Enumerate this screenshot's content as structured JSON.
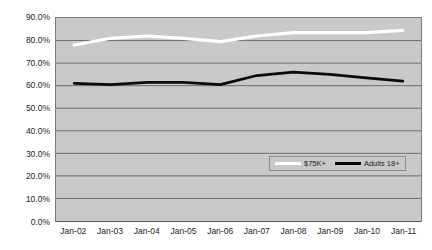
{
  "chart_data": {
    "type": "line",
    "title": "",
    "xlabel": "",
    "ylabel": "",
    "grid": true,
    "legend_position": "inside-bottom-right",
    "categories": [
      "Jan-02",
      "Jan-03",
      "Jan-04",
      "Jan-05",
      "Jan-06",
      "Jan-07",
      "Jan-08",
      "Jan-09",
      "Jan-10",
      "Jan-11"
    ],
    "ylim": [
      0,
      90
    ],
    "ytick_labels": [
      "90.0%",
      "80.0%",
      "70.0%",
      "60.0%",
      "50.0%",
      "40.0%",
      "30.0%",
      "20.0%",
      "10.0%",
      "0.0%"
    ],
    "ytick_values": [
      90,
      80,
      70,
      60,
      50,
      40,
      30,
      20,
      10,
      0
    ],
    "series": [
      {
        "name": "$75K+",
        "color": "#ffffff",
        "values": [
          78.0,
          81.0,
          82.0,
          81.0,
          79.5,
          82.0,
          83.5,
          83.5,
          83.5,
          84.5
        ]
      },
      {
        "name": "Adults 18+",
        "color": "#0a0a0a",
        "values": [
          61.0,
          60.5,
          61.5,
          61.5,
          60.5,
          64.5,
          66.0,
          65.0,
          63.5,
          62.0
        ]
      }
    ]
  },
  "legend": {
    "entries": [
      {
        "label": "$75K+",
        "swatch": "white-line-swatch"
      },
      {
        "label": "Adults 18+",
        "swatch": "black-line-swatch"
      }
    ]
  },
  "colors": {
    "plot_background": "#c9c9c9",
    "page_background": "#ffffff",
    "gridline": "#6f6f6f",
    "axis_text": "#1d1d1d",
    "series_high_income": "#ffffff",
    "series_adults": "#0a0a0a"
  }
}
